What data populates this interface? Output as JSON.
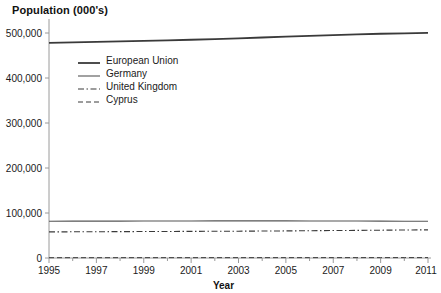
{
  "chart_data": {
    "type": "line",
    "title": "Population (000's)",
    "xlabel": "Year",
    "ylabel": "",
    "xlim": [
      1995,
      2011
    ],
    "ylim": [
      0,
      500000
    ],
    "grid": false,
    "legend_position": "upper-left-inside",
    "x": [
      1995,
      1996,
      1997,
      1998,
      1999,
      2000,
      2001,
      2002,
      2003,
      2004,
      2005,
      2006,
      2007,
      2008,
      2009,
      2010,
      2011
    ],
    "y_ticks": [
      0,
      100000,
      200000,
      300000,
      400000,
      500000
    ],
    "y_tick_labels": [
      "0",
      "100,000",
      "200,000",
      "300,000",
      "400,000",
      "500,000"
    ],
    "x_ticks": [
      1995,
      1996,
      1997,
      1998,
      1999,
      2000,
      2001,
      2002,
      2003,
      2004,
      2005,
      2006,
      2007,
      2008,
      2009,
      2010,
      2011
    ],
    "x_tick_labels": [
      "1995",
      "",
      "1997",
      "",
      "1999",
      "",
      "2001",
      "",
      "2003",
      "",
      "2005",
      "",
      "2007",
      "",
      "2009",
      "",
      "2011"
    ],
    "series": [
      {
        "name": "European Union",
        "style": "solid",
        "width": 1.8,
        "color": "#3a3a3a",
        "values": [
          478000,
          479200,
          480300,
          481400,
          482500,
          483700,
          485000,
          486400,
          488000,
          490000,
          492000,
          493800,
          495400,
          497000,
          498300,
          499300,
          500200
        ]
      },
      {
        "name": "Germany",
        "style": "solid",
        "width": 1.1,
        "color": "#555555",
        "values": [
          81700,
          82000,
          82050,
          82030,
          82100,
          82200,
          82340,
          82480,
          82530,
          82500,
          82460,
          82370,
          82260,
          82100,
          81900,
          81750,
          81800
        ]
      },
      {
        "name": "United Kingdom",
        "style": "dashdot",
        "width": 1.1,
        "color": "#3a3a3a",
        "values": [
          58000,
          58200,
          58400,
          58600,
          58800,
          59000,
          59200,
          59400,
          59600,
          59900,
          60200,
          60600,
          61000,
          61400,
          61800,
          62200,
          62600
        ]
      },
      {
        "name": "Cyprus",
        "style": "dashed",
        "width": 1.0,
        "color": "#3a3a3a",
        "values": [
          700,
          710,
          720,
          730,
          740,
          750,
          760,
          770,
          780,
          790,
          800,
          820,
          840,
          860,
          870,
          880,
          890
        ]
      }
    ]
  },
  "legend": {
    "items": [
      {
        "label": "European Union"
      },
      {
        "label": "Germany"
      },
      {
        "label": "United Kingdom"
      },
      {
        "label": "Cyprus"
      }
    ]
  },
  "colors": {
    "axis": "#9a9a9a",
    "text": "#1a1a1a",
    "background": "#ffffff"
  }
}
